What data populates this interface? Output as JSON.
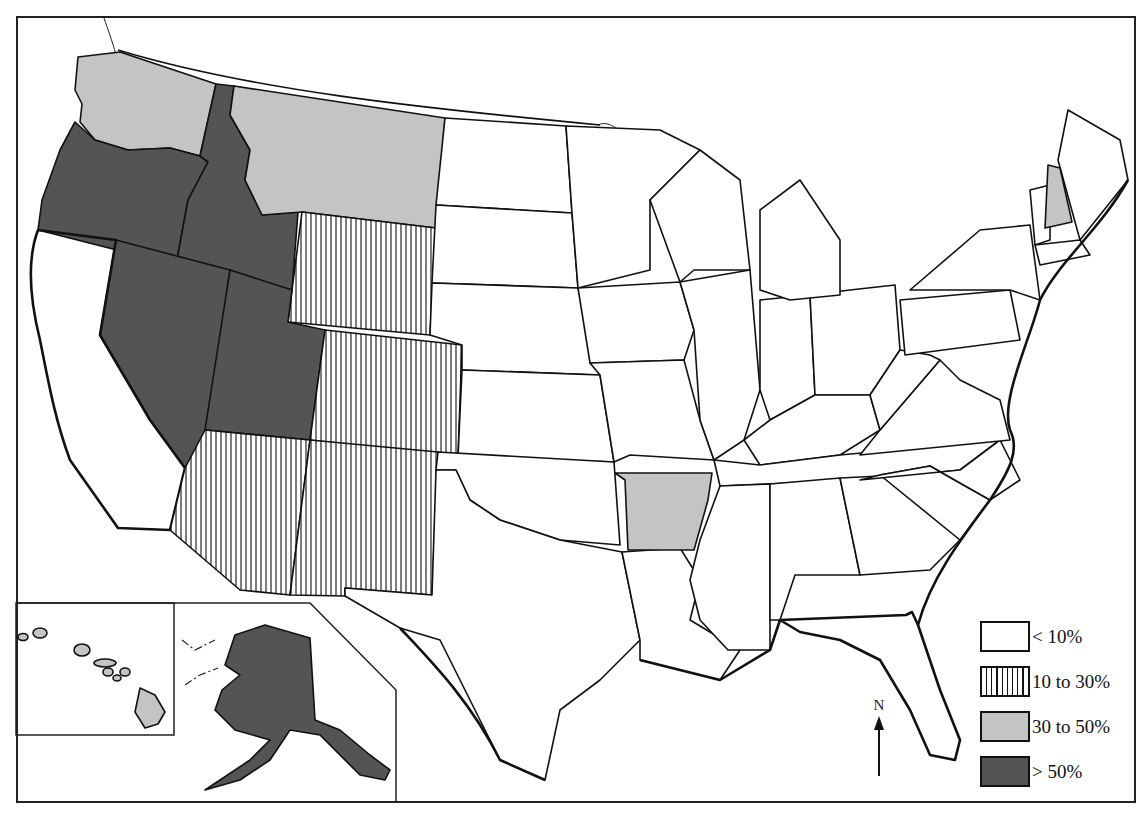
{
  "map": {
    "type": "choropleth",
    "region": "United States (by state)",
    "north_arrow_label": "N",
    "colors": {
      "lt10": "#ffffff",
      "10to30": "hatch-vertical",
      "30to50": "#c4c4c4",
      "gt50": "#545454",
      "border": "#111111"
    },
    "legend": {
      "items": [
        {
          "label": "< 10%",
          "fill": "#ffffff",
          "pattern": "none"
        },
        {
          "label": "10 to 30%",
          "fill": "#ffffff",
          "pattern": "vertical-hatch"
        },
        {
          "label": "30 to 50%",
          "fill": "#c4c4c4",
          "pattern": "none"
        },
        {
          "label": "> 50%",
          "fill": "#545454",
          "pattern": "none"
        }
      ]
    },
    "classes": {
      "gt50": [
        "Oregon",
        "Idaho",
        "Nevada",
        "Utah",
        "Alaska"
      ],
      "30to50": [
        "Washington",
        "Montana",
        "Arkansas",
        "Florida",
        "New Hampshire",
        "Hawaii"
      ],
      "10to30": [
        "California",
        "Arizona",
        "New Mexico",
        "Colorado",
        "Wyoming"
      ],
      "lt10": [
        "all other states"
      ]
    },
    "insets": [
      "Hawaii",
      "Alaska"
    ]
  }
}
